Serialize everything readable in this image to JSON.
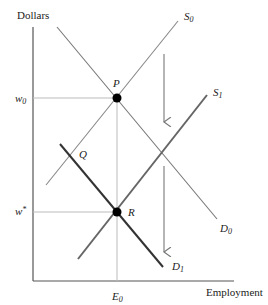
{
  "axes": {
    "y_label": "Dollars",
    "x_label": "Employment"
  },
  "ticks": {
    "w0": {
      "main": "w",
      "sub": "0"
    },
    "wstar": {
      "main": "w",
      "sup": "*"
    },
    "E0": {
      "main": "E",
      "sub": "0"
    }
  },
  "curves": {
    "S0": {
      "main": "S",
      "sub": "0",
      "style": "thin gray"
    },
    "S1": {
      "main": "S",
      "sub": "1",
      "style": "thick gray"
    },
    "D0": {
      "main": "D",
      "sub": "0",
      "style": "thin gray"
    },
    "D1": {
      "main": "D",
      "sub": "1",
      "style": "thick dark"
    }
  },
  "points": {
    "P": "P",
    "Q": "Q",
    "R": "R"
  },
  "arrows": [
    {
      "direction": "down",
      "meaning": "supply shift"
    },
    {
      "direction": "down",
      "meaning": "demand shift"
    }
  ],
  "colors": {
    "axis": "#555555",
    "thin_line": "#777777",
    "thick_gray": "#666666",
    "thick_dark": "#333333",
    "guide": "#bbbbbb",
    "point": "#000000"
  }
}
